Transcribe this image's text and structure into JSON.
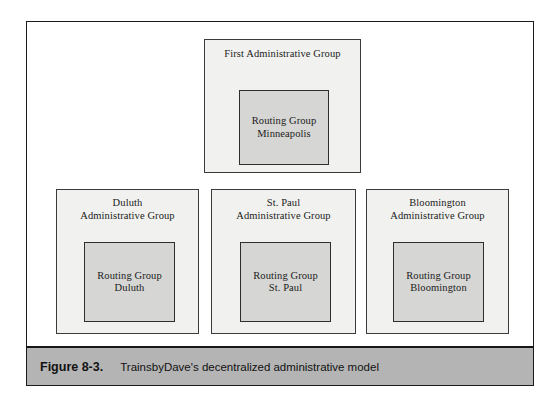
{
  "figure": {
    "caption_number": "Figure 8-3.",
    "caption_text": "TrainsbyDave's decentralized administrative model",
    "colors": {
      "frame_border": "#1a1a1a",
      "admin_group_fill": "#f1f1ef",
      "admin_group_border": "#3b3b3b",
      "routing_group_fill": "#d6d6d4",
      "routing_group_border": "#2e2e2e",
      "caption_bar_fill": "#b4b4b4",
      "page_background": "#ffffff",
      "text": "#1b1b1b"
    }
  },
  "diagram": {
    "top_group": {
      "admin_label": "First Administrative Group",
      "routing_label": "Routing Group\nMinneapolis"
    },
    "bottom_groups": [
      {
        "admin_label": "Duluth\nAdministrative Group",
        "routing_label": "Routing Group\nDuluth"
      },
      {
        "admin_label": "St. Paul\nAdministrative Group",
        "routing_label": "Routing Group\nSt. Paul"
      },
      {
        "admin_label": "Bloomington\nAdministrative Group",
        "routing_label": "Routing Group\nBloomington"
      }
    ]
  }
}
